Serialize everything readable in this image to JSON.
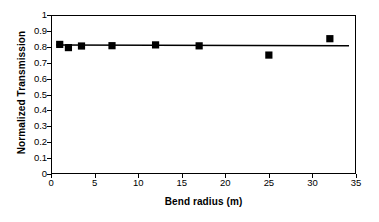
{
  "chart_data": {
    "type": "scatter",
    "title": "",
    "xlabel": "Bend radius (m)",
    "ylabel": "Normalized Transmission",
    "xlim": [
      0,
      35
    ],
    "ylim": [
      0,
      1
    ],
    "xticks": [
      0,
      5,
      10,
      15,
      20,
      25,
      30,
      35
    ],
    "yticks": [
      0,
      0.1,
      0.2,
      0.3,
      0.4,
      0.5,
      0.6,
      0.7,
      0.8,
      0.9,
      1
    ],
    "ytick_labels": [
      "0",
      "0.1",
      "0.2",
      "0.3",
      "0.4",
      "0.5",
      "0.6",
      "0.7",
      "0.8",
      "0.9",
      "1"
    ],
    "xtick_labels": [
      "0",
      "5",
      "10",
      "15",
      "20",
      "25",
      "30",
      "35"
    ],
    "grid": false,
    "legend": false,
    "marker": "filled-square",
    "marker_color": "#000000",
    "line_color": "#000000",
    "series": [
      {
        "name": "Measured transmission",
        "x": [
          1,
          2,
          3.5,
          7,
          12,
          17,
          25,
          32
        ],
        "y": [
          0.815,
          0.795,
          0.805,
          0.807,
          0.812,
          0.806,
          0.748,
          0.851
        ]
      }
    ],
    "trendline": {
      "name": "Linear fit",
      "x": [
        0.6,
        34.2
      ],
      "y": [
        0.812,
        0.806
      ]
    }
  },
  "axis": {
    "x_title": "Bend radius (m)",
    "y_title": "Normalized Transmission"
  }
}
